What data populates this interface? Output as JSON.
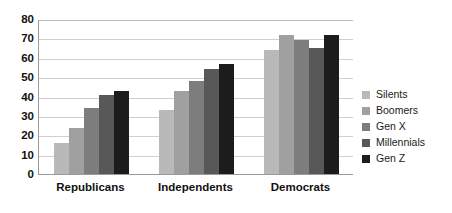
{
  "chart_data": {
    "type": "bar",
    "title": "",
    "subtitle": "",
    "xlabel": "",
    "ylabel": "",
    "categories": [
      "Republicans",
      "Independents",
      "Democrats"
    ],
    "series": [
      {
        "name": "Silents",
        "color": "#b9b9b9",
        "values": [
          16,
          33,
          64
        ]
      },
      {
        "name": "Boomers",
        "color": "#a0a0a0",
        "values": [
          24,
          43,
          72
        ]
      },
      {
        "name": "Gen X",
        "color": "#7d7d7d",
        "values": [
          34,
          48,
          69
        ]
      },
      {
        "name": "Millennials",
        "color": "#585858",
        "values": [
          41,
          54,
          65
        ]
      },
      {
        "name": "Gen Z",
        "color": "#1c1c1c",
        "values": [
          43,
          57,
          72
        ]
      }
    ],
    "ylim": [
      0,
      80
    ],
    "ytick_values": [
      0,
      10,
      20,
      30,
      40,
      50,
      60,
      70,
      80
    ],
    "ytick_labels": [
      "0",
      "10",
      "20",
      "30",
      "40",
      "50",
      "60",
      "70",
      "80"
    ],
    "grid": true,
    "grid_color": "#cfcfcf",
    "legend_position": "right",
    "axis_color": "#9a9a9a",
    "background": "#ffffff"
  }
}
